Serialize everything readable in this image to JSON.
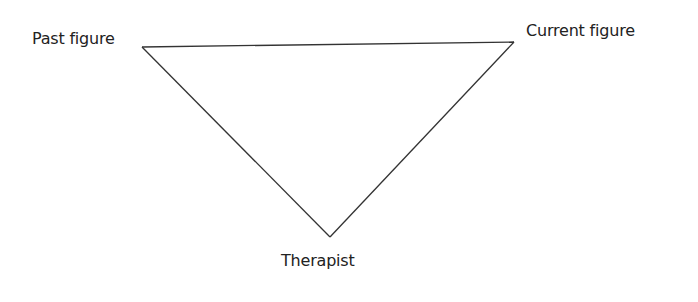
{
  "diagram": {
    "type": "triangle",
    "line_color": "#333333",
    "nodes": [
      {
        "id": "past",
        "label": "Past figure",
        "x": 142,
        "y": 47
      },
      {
        "id": "current",
        "label": "Current figure",
        "x": 514,
        "y": 42
      },
      {
        "id": "therapist",
        "label": "Therapist",
        "x": 330,
        "y": 237
      }
    ],
    "edges": [
      [
        "past",
        "current"
      ],
      [
        "past",
        "therapist"
      ],
      [
        "current",
        "therapist"
      ]
    ]
  }
}
